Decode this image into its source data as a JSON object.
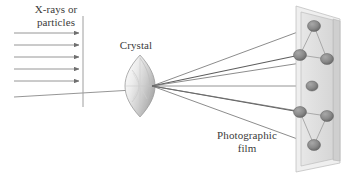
{
  "figure": {
    "kind": "x-ray-diffraction-diagram",
    "width": 346,
    "height": 177,
    "background": "#ffffff"
  },
  "labels": {
    "source": "X-rays or\nparticles",
    "crystal": "Crystal",
    "film": "Photographic\nfilm"
  },
  "colors": {
    "ray": "#7a7a7a",
    "ray_dark": "#5e5e5e",
    "spot": "#8c8c8c",
    "spot_dark": "#6e6e6e",
    "film_face": "#e2e2e2",
    "film_edge": "#b4b4b4",
    "film_side": "#cfcfcf",
    "crystal_light": "#f2f2f2",
    "crystal_mid": "#d8d8d8",
    "crystal_dark": "#9a9a9a",
    "text": "#3b3b3b",
    "divider": "#9e9e9e"
  },
  "incident_beam": {
    "description": "Parallel horizontal arrows travelling left to right",
    "count": 6,
    "x_start": 14,
    "arrows": [
      {
        "y": 33,
        "x_end": 79,
        "long": false
      },
      {
        "y": 45,
        "x_end": 79,
        "long": false
      },
      {
        "y": 57,
        "x_end": 79,
        "long": false
      },
      {
        "y": 69,
        "x_end": 79,
        "long": false
      },
      {
        "y": 81,
        "x_end": 79,
        "long": false
      },
      {
        "y": 97,
        "x_end": 133,
        "long": true
      }
    ],
    "divider_line": {
      "x": 83,
      "y1": 16,
      "y2": 107
    }
  },
  "crystal": {
    "center_x": 140,
    "center_y": 82,
    "half_width": 15,
    "half_height": 27,
    "shape": "pointed-oval-lens"
  },
  "diffracted_beams": {
    "origin_x": 152,
    "origin_y": 86,
    "count": 7
  },
  "film": {
    "description": "Tilted rectangular film panel drawn in perspective",
    "face": "301,10 333,19 333,160 301,168",
    "side": "333,19 339,21 339,160 333,160",
    "outline": "296,6 340,19 340,163 296,172",
    "spots": [
      {
        "id": "spot-top",
        "cx": 314,
        "cy": 26,
        "rx": 6.5,
        "ry": 5.5
      },
      {
        "id": "spot-upper-left",
        "cx": 300,
        "cy": 55,
        "rx": 6.5,
        "ry": 5.5
      },
      {
        "id": "spot-upper-right",
        "cx": 327,
        "cy": 59,
        "rx": 6.5,
        "ry": 5.5
      },
      {
        "id": "spot-center",
        "cx": 312,
        "cy": 86,
        "rx": 6.0,
        "ry": 5.0
      },
      {
        "id": "spot-lower-left",
        "cx": 300,
        "cy": 112,
        "rx": 6.5,
        "ry": 5.5
      },
      {
        "id": "spot-lower-right",
        "cx": 327,
        "cy": 116,
        "rx": 6.5,
        "ry": 5.5
      },
      {
        "id": "spot-bottom",
        "cx": 314,
        "cy": 145,
        "rx": 6.5,
        "ry": 5.5
      }
    ],
    "connectors": [
      [
        314,
        26,
        300,
        55
      ],
      [
        314,
        26,
        327,
        59
      ],
      [
        300,
        55,
        327,
        59
      ],
      [
        300,
        112,
        327,
        116
      ],
      [
        300,
        112,
        314,
        145
      ],
      [
        327,
        116,
        314,
        145
      ]
    ]
  }
}
